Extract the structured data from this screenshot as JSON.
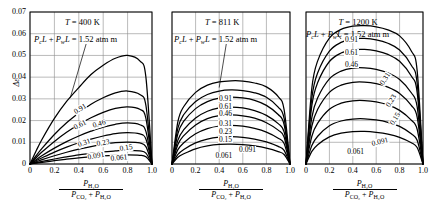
{
  "figure": {
    "y_axis_label": "Δε",
    "y_ticks": [
      "0",
      "0.01",
      "0.02",
      "0.03",
      "0.04",
      "0.05",
      "0.06",
      "0.07"
    ],
    "x_ticks": [
      "0",
      "0.2",
      "0.4",
      "0.6",
      "0.8",
      "1.0"
    ],
    "x_axis_numerator": "P",
    "x_axis_numerator_sub": "H₂O",
    "x_axis_denominator_a": "P",
    "x_axis_denominator_a_sub": "CO₂",
    "x_axis_denominator_plus": "+",
    "x_axis_denominator_b": "P",
    "x_axis_denominator_b_sub": "H₂O",
    "annotation": "PₑL + PᵥL = 1.52 atm m",
    "annotation_parts": {
      "pc": "P",
      "pc_sub": "c",
      "L1": "L",
      "plus": "+",
      "pw": "P",
      "pw_sub": "w",
      "L2": "L",
      "eq": "= 1.52 atm m"
    },
    "curve_labels": [
      "0.91",
      "0.61",
      "0.46",
      "0.31",
      "0.23",
      "0.15",
      "0.091",
      "0.061"
    ],
    "line_color": "#000000",
    "grid_color": "#8c8c8c",
    "background": "#ffffff"
  },
  "panels": [
    {
      "id": "panel-400k",
      "title": "T = 400 K",
      "title_var": "T",
      "title_value": "= 400 K",
      "temperature_k": 400
    },
    {
      "id": "panel-811k",
      "title": "T = 811 K",
      "title_var": "T",
      "title_value": "= 811 K",
      "temperature_k": 811
    },
    {
      "id": "panel-1200k",
      "title": "T = 1200 K",
      "title_var": "T",
      "title_value": "= 1200 K",
      "temperature_k": 1200
    }
  ],
  "chart_data": {
    "type": "line",
    "xlabel": "P_H2O / (P_CO2 + P_H2O)",
    "ylabel": "Δε",
    "xlim": [
      0,
      1.0
    ],
    "ylim": [
      0,
      0.07
    ],
    "xticks": [
      0,
      0.2,
      0.4,
      0.6,
      0.8,
      1.0
    ],
    "yticks": [
      0,
      0.01,
      0.02,
      0.03,
      0.04,
      0.05,
      0.06,
      0.07
    ],
    "grid": true,
    "legend": "inline-curve-labels",
    "annotation": "P_c L + P_w L = 1.52 atm m",
    "subplots": [
      {
        "name": "T = 400 K",
        "temperature_k": 400,
        "x": [
          0,
          0.05,
          0.1,
          0.2,
          0.3,
          0.4,
          0.5,
          0.6,
          0.7,
          0.8,
          0.9,
          0.95,
          1.0
        ],
        "series": [
          {
            "name": "0.91",
            "values": [
              0,
              0.006,
              0.0115,
              0.021,
              0.0288,
              0.0352,
              0.0412,
              0.0455,
              0.0487,
              0.05,
              0.0475,
              0.04,
              0.0
            ]
          },
          {
            "name": "0.61",
            "values": [
              0,
              0.0038,
              0.0073,
              0.0136,
              0.019,
              0.0235,
              0.0275,
              0.0305,
              0.0328,
              0.0336,
              0.032,
              0.027,
              0.0
            ]
          },
          {
            "name": "0.46",
            "values": [
              0,
              0.0029,
              0.0056,
              0.0104,
              0.0146,
              0.0182,
              0.0213,
              0.0238,
              0.0256,
              0.0263,
              0.0252,
              0.021,
              0.0
            ]
          },
          {
            "name": "0.31",
            "values": [
              0,
              0.002,
              0.0039,
              0.0073,
              0.0103,
              0.0129,
              0.0151,
              0.017,
              0.0183,
              0.0189,
              0.0181,
              0.015,
              0.0
            ]
          },
          {
            "name": "0.23",
            "values": [
              0,
              0.0015,
              0.0029,
              0.0055,
              0.0078,
              0.0098,
              0.0115,
              0.0129,
              0.014,
              0.0145,
              0.0139,
              0.0115,
              0.0
            ]
          },
          {
            "name": "0.15",
            "values": [
              0,
              0.001,
              0.002,
              0.0038,
              0.0054,
              0.0068,
              0.008,
              0.009,
              0.0098,
              0.0101,
              0.0097,
              0.008,
              0.0
            ]
          },
          {
            "name": "0.091",
            "values": [
              0,
              0.0006,
              0.0012,
              0.0023,
              0.0033,
              0.0042,
              0.0049,
              0.0056,
              0.006,
              0.0063,
              0.006,
              0.005,
              0.0
            ]
          },
          {
            "name": "0.061",
            "values": [
              0,
              0.0004,
              0.0008,
              0.0015,
              0.0022,
              0.0028,
              0.0033,
              0.0037,
              0.004,
              0.0042,
              0.004,
              0.0033,
              0.0
            ]
          }
        ]
      },
      {
        "name": "T = 811 K",
        "temperature_k": 811,
        "x": [
          0,
          0.05,
          0.1,
          0.2,
          0.3,
          0.4,
          0.5,
          0.6,
          0.7,
          0.8,
          0.9,
          0.95,
          1.0
        ],
        "series": [
          {
            "name": "0.91",
            "values": [
              0,
              0.0195,
              0.0265,
              0.033,
              0.0363,
              0.0378,
              0.0383,
              0.0382,
              0.0373,
              0.0355,
              0.031,
              0.025,
              0.0
            ]
          },
          {
            "name": "0.61",
            "values": [
              0,
              0.0165,
              0.0228,
              0.0288,
              0.032,
              0.0336,
              0.0341,
              0.0338,
              0.0328,
              0.0307,
              0.0262,
              0.021,
              0.0
            ]
          },
          {
            "name": "0.46",
            "values": [
              0,
              0.014,
              0.0197,
              0.0255,
              0.0287,
              0.0303,
              0.0308,
              0.0304,
              0.0293,
              0.027,
              0.0228,
              0.0182,
              0.0
            ]
          },
          {
            "name": "0.31",
            "values": [
              0,
              0.011,
              0.0158,
              0.0212,
              0.0243,
              0.0258,
              0.0262,
              0.0258,
              0.0246,
              0.0224,
              0.0186,
              0.0148,
              0.0
            ]
          },
          {
            "name": "0.23",
            "values": [
              0,
              0.009,
              0.0131,
              0.018,
              0.0209,
              0.0223,
              0.0226,
              0.0222,
              0.0211,
              0.019,
              0.0156,
              0.0124,
              0.0
            ]
          },
          {
            "name": "0.15",
            "values": [
              0,
              0.0066,
              0.0098,
              0.0139,
              0.0163,
              0.0175,
              0.0178,
              0.0174,
              0.0164,
              0.0147,
              0.0119,
              0.0094,
              0.0
            ]
          },
          {
            "name": "0.091",
            "values": [
              0,
              0.0044,
              0.0067,
              0.0097,
              0.0115,
              0.0124,
              0.0126,
              0.0123,
              0.0115,
              0.0102,
              0.0081,
              0.0063,
              0.0
            ]
          },
          {
            "name": "0.061",
            "values": [
              0,
              0.0031,
              0.0047,
              0.007,
              0.0083,
              0.009,
              0.0091,
              0.0089,
              0.0083,
              0.0073,
              0.0057,
              0.0044,
              0.0
            ]
          }
        ]
      },
      {
        "name": "T = 1200 K",
        "temperature_k": 1200,
        "x": [
          0,
          0.05,
          0.1,
          0.2,
          0.3,
          0.4,
          0.5,
          0.6,
          0.7,
          0.8,
          0.9,
          0.95,
          1.0
        ],
        "series": [
          {
            "name": "0.91",
            "values": [
              0,
              0.035,
              0.0475,
              0.058,
              0.062,
              0.0635,
              0.0637,
              0.0632,
              0.0618,
              0.059,
              0.052,
              0.043,
              0.0
            ]
          },
          {
            "name": "0.61",
            "values": [
              0,
              0.0305,
              0.042,
              0.052,
              0.056,
              0.0576,
              0.0578,
              0.0572,
              0.0556,
              0.0525,
              0.0455,
              0.0372,
              0.0
            ]
          },
          {
            "name": "0.46",
            "values": [
              0,
              0.027,
              0.0375,
              0.0472,
              0.0511,
              0.0526,
              0.0528,
              0.0521,
              0.0505,
              0.0473,
              0.0405,
              0.033,
              0.0
            ]
          },
          {
            "name": "0.31",
            "values": [
              0,
              0.0215,
              0.0305,
              0.0392,
              0.0428,
              0.0442,
              0.0443,
              0.0436,
              0.042,
              0.0389,
              0.0328,
              0.0264,
              0.0
            ]
          },
          {
            "name": "0.23",
            "values": [
              0,
              0.0175,
              0.0252,
              0.033,
              0.0363,
              0.0376,
              0.0377,
              0.037,
              0.0354,
              0.0325,
              0.027,
              0.0216,
              0.0
            ]
          },
          {
            "name": "0.15",
            "values": [
              0,
              0.0128,
              0.0188,
              0.0252,
              0.028,
              0.0291,
              0.0292,
              0.0286,
              0.0272,
              0.0247,
              0.0202,
              0.016,
              0.0
            ]
          },
          {
            "name": "0.091",
            "values": [
              0,
              0.0085,
              0.0128,
              0.0176,
              0.0198,
              0.0207,
              0.0208,
              0.0203,
              0.0192,
              0.0173,
              0.0139,
              0.0109,
              0.0
            ]
          },
          {
            "name": "0.061",
            "values": [
              0,
              0.0058,
              0.0089,
              0.0125,
              0.0142,
              0.0149,
              0.015,
              0.0146,
              0.0138,
              0.0123,
              0.0098,
              0.0076,
              0.0
            ]
          }
        ]
      }
    ]
  },
  "layout": {
    "panel_geom": [
      {
        "left": 30,
        "top": 12,
        "width": 122,
        "height": 152
      },
      {
        "left": 172,
        "top": 12,
        "width": 118,
        "height": 152
      },
      {
        "left": 306,
        "top": 12,
        "width": 117,
        "height": 152
      }
    ],
    "curve_label_positions": [
      [
        {
          "x": 0.425,
          "y": 0.0255,
          "rot": -32
        },
        {
          "x": 0.425,
          "y": 0.018,
          "rot": -28
        },
        {
          "x": 0.585,
          "y": 0.0185,
          "rot": -17
        },
        {
          "x": 0.455,
          "y": 0.0098,
          "rot": -20
        },
        {
          "x": 0.615,
          "y": 0.0098,
          "rot": -10
        },
        {
          "x": 0.8,
          "y": 0.0072,
          "rot": -9
        },
        {
          "x": 0.545,
          "y": 0.0035,
          "rot": -10
        },
        {
          "x": 0.73,
          "y": 0.0028,
          "rot": -6
        }
      ],
      [
        {
          "x": 0.47,
          "y": 0.03,
          "rot": 0
        },
        {
          "x": 0.47,
          "y": 0.0262,
          "rot": 0
        },
        {
          "x": 0.47,
          "y": 0.0228,
          "rot": 0
        },
        {
          "x": 0.47,
          "y": 0.0182,
          "rot": 0
        },
        {
          "x": 0.47,
          "y": 0.0148,
          "rot": 0
        },
        {
          "x": 0.47,
          "y": 0.0112,
          "rot": 0
        },
        {
          "x": 0.64,
          "y": 0.0066,
          "rot": 0
        },
        {
          "x": 0.44,
          "y": 0.0038,
          "rot": 0
        }
      ],
      [
        {
          "x": 0.405,
          "y": 0.0572,
          "rot": 0
        },
        {
          "x": 0.405,
          "y": 0.0512,
          "rot": 0
        },
        {
          "x": 0.405,
          "y": 0.0456,
          "rot": 0
        },
        {
          "x": 0.69,
          "y": 0.0392,
          "rot": -58
        },
        {
          "x": 0.74,
          "y": 0.0292,
          "rot": -58
        },
        {
          "x": 0.775,
          "y": 0.0205,
          "rot": -58
        },
        {
          "x": 0.635,
          "y": 0.0102,
          "rot": -14
        },
        {
          "x": 0.425,
          "y": 0.0055,
          "rot": 0
        }
      ]
    ]
  }
}
